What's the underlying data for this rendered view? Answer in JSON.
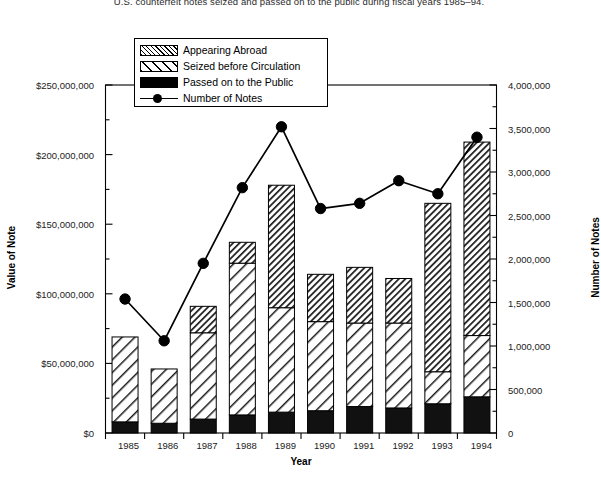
{
  "title": "U.S. counterfeit notes seized and passed on to the public during fiscal years 1985–94.",
  "axes": {
    "x_title": "Year",
    "y_left_title": "Value of Note",
    "y_right_title": "Number of Notes",
    "y_left_ticks": [
      "$0",
      "$50,000,000",
      "$100,000,000",
      "$150,000,000",
      "$200,000,000",
      "$250,000,000"
    ],
    "y_right_ticks": [
      "0",
      "500,000",
      "1,000,000",
      "1,500,000",
      "2,000,000",
      "2,500,000",
      "3,000,000",
      "3,500,000",
      "4,000,000"
    ],
    "x_ticks": [
      "1985",
      "1986",
      "1987",
      "1988",
      "1989",
      "1990",
      "1991",
      "1992",
      "1993",
      "1994"
    ]
  },
  "legend": {
    "items": [
      {
        "label": "Appearing Abroad",
        "swatch": "dense-hatch-swatch"
      },
      {
        "label": "Seized before Circulation",
        "swatch": "sparse-hatch-swatch"
      },
      {
        "label": "Passed on to the Public",
        "swatch": "solid-black-swatch"
      },
      {
        "label": "Number of Notes",
        "swatch": "line-marker-swatch"
      }
    ]
  },
  "colors": {
    "ink": "#000000",
    "background": "#ffffff",
    "marker": "#000000"
  },
  "chart_data": {
    "type": "bar",
    "subtype": "stacked-bar-with-line-overlay",
    "title": "U.S. counterfeit notes seized and passed on to the public during fiscal years 1985–94.",
    "xlabel": "Year",
    "ylabel": "Value of Note",
    "ylabel_secondary": "Number of Notes",
    "categories": [
      "1985",
      "1986",
      "1987",
      "1988",
      "1989",
      "1990",
      "1991",
      "1992",
      "1993",
      "1994"
    ],
    "ylim": [
      0,
      250000000
    ],
    "ylim_secondary": [
      0,
      4000000
    ],
    "ytick_step": 50000000,
    "ytick_step_secondary": 500000,
    "grid": false,
    "legend_position": "upper-left-inside",
    "series": [
      {
        "name": "Passed on to the Public",
        "axis": "left",
        "kind": "bar-segment",
        "values": [
          8000000,
          7000000,
          10000000,
          13000000,
          15000000,
          16000000,
          19000000,
          18000000,
          21000000,
          26000000
        ]
      },
      {
        "name": "Seized before Circulation",
        "axis": "left",
        "kind": "bar-segment",
        "values": [
          61000000,
          39000000,
          62000000,
          109000000,
          75000000,
          64000000,
          60000000,
          61000000,
          23000000,
          44000000
        ]
      },
      {
        "name": "Appearing Abroad",
        "axis": "left",
        "kind": "bar-segment",
        "values": [
          0,
          0,
          19000000,
          15000000,
          88000000,
          34000000,
          40000000,
          32000000,
          121000000,
          139000000
        ]
      },
      {
        "name": "Number of Notes",
        "axis": "right",
        "kind": "line",
        "values": [
          1540000,
          1060000,
          1950000,
          2820000,
          3520000,
          2580000,
          2640000,
          2900000,
          2750000,
          3400000
        ]
      }
    ],
    "totals_value_of_note": [
      69000000,
      46000000,
      91000000,
      137000000,
      178000000,
      114000000,
      119000000,
      111000000,
      165000000,
      209000000
    ]
  }
}
